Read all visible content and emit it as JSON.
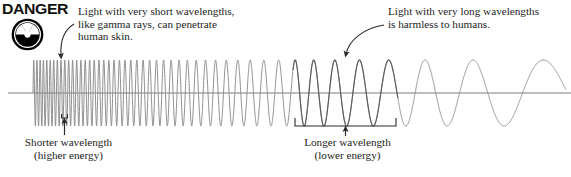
{
  "figure": {
    "background_color": "#ffffff",
    "width": 571,
    "height": 177
  },
  "warning": {
    "word": "DANGER",
    "icon": "radiation-trefoil-icon",
    "icon_color": "#000000"
  },
  "callouts": [
    {
      "id": "short-wavelength-callout",
      "text": "Light with very short wavelengths,\nlike gamma rays, can penetrate\nhuman skin.",
      "arrow": "curved-arrow-down-left"
    },
    {
      "id": "long-wavelength-callout",
      "text": "Light with very long wavelengths\nis harmless to humans.",
      "arrow": "curved-arrow-down-left"
    }
  ],
  "axis_labels": [
    {
      "id": "shorter-wavelength-label",
      "text": "Shorter wavelength\n(higher energy)",
      "bracket": "short-wavelength-bracket"
    },
    {
      "id": "longer-wavelength-label",
      "text": "Longer wavelength\n(lower energy)",
      "bracket": "long-wavelength-bracket"
    }
  ],
  "colors": {
    "wave_stroke": "#8a8a8a",
    "wave_stroke_dark": "#6f6f6f",
    "baseline": "#7a7a7a",
    "annotation": "#2a2a2a",
    "text": "#1c1c1c"
  },
  "chart_data": {
    "type": "line",
    "xlabel": "",
    "ylabel": "",
    "x_axis_baseline_y": 93,
    "wave_start_x": 33,
    "wave_end_x": 566,
    "amplitude": 33,
    "wavelength_px_start": 3.1,
    "wavelength_px_end": 104,
    "grid": false,
    "legend": false,
    "annotations": [
      {
        "label": "Shorter wavelength (higher energy)",
        "x": 63,
        "note": "left end, tightly packed oscillations"
      },
      {
        "label": "Longer wavelength (lower energy)",
        "x": 345,
        "note": "right end, broad oscillations"
      }
    ]
  }
}
